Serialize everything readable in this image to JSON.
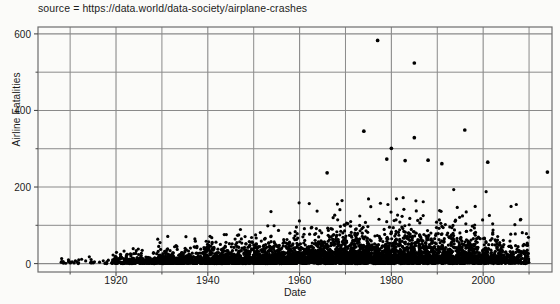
{
  "figure": {
    "caption": "source = https://data.world/data-society/airplane-crashes",
    "background_color": "#fbfbf9",
    "grid_color": "#8a8a8a",
    "axis_color": "#6d6d6d",
    "marker_color": "#000000"
  },
  "chart_data": {
    "type": "scatter",
    "title": "source = https://data.world/data-society/airplane-crashes",
    "xlabel": "Date",
    "ylabel": "Airline Fatalities",
    "xlim": [
      1903,
      2015
    ],
    "ylim": [
      -22,
      618
    ],
    "xticks": [
      1920,
      1940,
      1960,
      1980,
      2000
    ],
    "xtick_labels": [
      "1920",
      "1940",
      "1960",
      "1980",
      "2000"
    ],
    "xminor_ticks": [
      1910,
      1930,
      1950,
      1970,
      1990,
      2010
    ],
    "yticks": [
      0,
      200,
      400,
      600
    ],
    "ytick_labels": [
      "0",
      "200",
      "400",
      "600"
    ],
    "yminor_ticks": [
      100,
      300,
      500
    ],
    "grid": true,
    "legend": null,
    "marker": "filled-circle",
    "marker_size_px": 3.2,
    "point_count_approx": 5200,
    "notable_points": [
      {
        "x": 1977,
        "y": 583,
        "note": "highest fatality event"
      },
      {
        "x": 1985,
        "y": 524,
        "note": "second highest"
      },
      {
        "x": 1974,
        "y": 346
      },
      {
        "x": 1996,
        "y": 349
      },
      {
        "x": 1985,
        "y": 329
      },
      {
        "x": 1980,
        "y": 301
      },
      {
        "x": 1979,
        "y": 273
      },
      {
        "x": 1988,
        "y": 270
      },
      {
        "x": 1991,
        "y": 261
      },
      {
        "x": 2001,
        "y": 265
      },
      {
        "x": 1983,
        "y": 269
      },
      {
        "x": 1966,
        "y": 237
      },
      {
        "x": 2014,
        "y": 239
      }
    ],
    "density_description": "Dense band of points between 0 and about 80 fatalities spanning 1920-2010, widening and thickening after 1945; sparse isolated points above 150; almost no data before 1918; no data after about 2010.",
    "series": [
      {
        "name": "Airline Fatalities per crash",
        "eras": [
          {
            "x_start": 1908,
            "x_end": 1919,
            "count": 34,
            "y_max": 35,
            "y_typical": 6,
            "spread": "very sparse"
          },
          {
            "x_start": 1919,
            "x_end": 1929,
            "count": 240,
            "y_max": 60,
            "y_typical": 8,
            "spread": "thin band"
          },
          {
            "x_start": 1929,
            "x_end": 1939,
            "count": 430,
            "y_max": 75,
            "y_typical": 11,
            "spread": "thin band"
          },
          {
            "x_start": 1939,
            "x_end": 1949,
            "count": 620,
            "y_max": 120,
            "y_typical": 14,
            "spread": "band widening"
          },
          {
            "x_start": 1949,
            "x_end": 1959,
            "count": 700,
            "y_max": 140,
            "y_typical": 16,
            "spread": "band widening"
          },
          {
            "x_start": 1959,
            "x_end": 1969,
            "count": 740,
            "y_max": 240,
            "y_typical": 20,
            "spread": "scattered upper tail"
          },
          {
            "x_start": 1969,
            "x_end": 1979,
            "count": 740,
            "y_max": 583,
            "y_typical": 24,
            "spread": "heavy upper tail"
          },
          {
            "x_start": 1979,
            "x_end": 1989,
            "count": 700,
            "y_max": 524,
            "y_typical": 26,
            "spread": "heavy upper tail"
          },
          {
            "x_start": 1989,
            "x_end": 1999,
            "count": 620,
            "y_max": 349,
            "y_typical": 24,
            "spread": "heavy upper tail"
          },
          {
            "x_start": 1999,
            "x_end": 2010,
            "count": 420,
            "y_max": 265,
            "y_typical": 20,
            "spread": "thinning"
          }
        ]
      }
    ]
  }
}
